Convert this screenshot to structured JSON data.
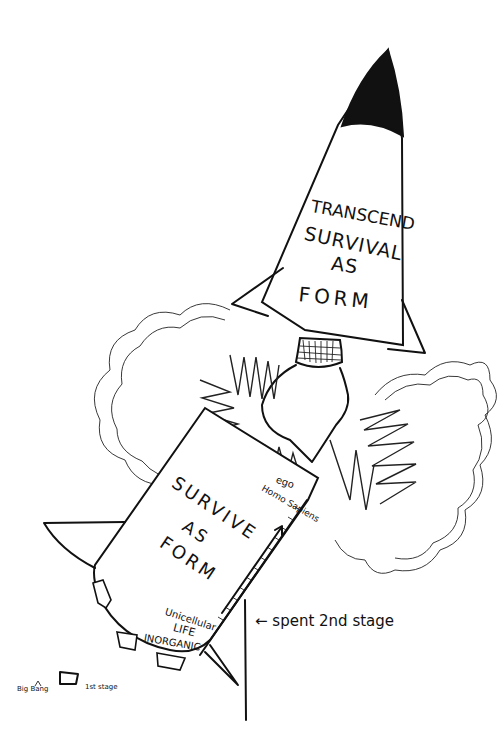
{
  "illustration": {
    "upper_stage": {
      "lines": [
        "TRANSCEND",
        "SURVIVAL",
        "AS",
        "FORM"
      ]
    },
    "lower_stage": {
      "lines": [
        "SURVIVE",
        "AS",
        "FORM"
      ],
      "scale_top_labels": [
        "ego",
        "Homo Sapiens"
      ],
      "scale_bottom_labels": [
        "Unicellular",
        "LIFE",
        "INORGANIC"
      ]
    },
    "annotations": {
      "spent_stage": "← spent 2nd stage",
      "big_bang": "Big Bang",
      "first_stage": "1st stage"
    },
    "colors": {
      "ink": "#111111",
      "paper": "#ffffff"
    }
  }
}
